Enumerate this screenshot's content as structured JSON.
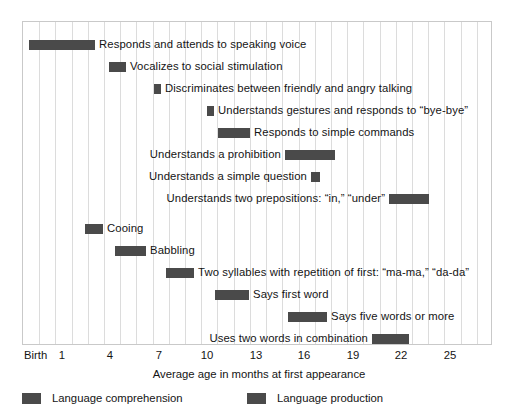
{
  "chart_data": {
    "type": "bar",
    "title": "",
    "subtitle": "",
    "xlabel": "Average age in months at first appearance",
    "ylabel": "",
    "xlim": [
      0,
      29
    ],
    "grid": true,
    "orientation": "horizontal",
    "legend_position": "bottom-left",
    "tick_labels": [
      "Birth",
      "1",
      "4",
      "7",
      "10",
      "13",
      "16",
      "19",
      "22",
      "25"
    ],
    "tick_values": [
      0,
      1,
      4,
      7,
      10,
      13,
      16,
      19,
      22,
      25
    ],
    "legend": [
      {
        "name": "Language comprehension",
        "color": "#4a4a4a"
      },
      {
        "name": "Language production",
        "color": "#4a4a4a"
      }
    ],
    "series": [
      {
        "name": "Language comprehension",
        "color": "#4a4a4a",
        "items": [
          {
            "label": "Responds and attends to speaking voice",
            "start": 0.3,
            "end": 4.5,
            "label_side": "right"
          },
          {
            "label": "Vocalizes to social stimulation",
            "start": 5.3,
            "end": 6.3,
            "label_side": "right"
          },
          {
            "label": "Discriminates between friendly and angry talking",
            "start": 8.5,
            "end": 8.9,
            "label_side": "right"
          },
          {
            "label": "Understands gestures and responds to “bye-bye”",
            "start": 11.8,
            "end": 12.2,
            "label_side": "right"
          },
          {
            "label": "Responds to simple commands",
            "start": 12.8,
            "end": 14.8,
            "label_side": "right"
          },
          {
            "label": "Understands a prohibition",
            "start": 17.0,
            "end": 20.1,
            "label_side": "left"
          },
          {
            "label": "Understands a simple question",
            "start": 18.5,
            "end": 19.0,
            "label_side": "left"
          },
          {
            "label": "Understands two prepositions: “in,” “under”",
            "start": 23.3,
            "end": 25.8,
            "label_side": "left"
          }
        ]
      },
      {
        "name": "Language production",
        "color": "#4a4a4a",
        "items": [
          {
            "label": "Cooing",
            "start": 3.8,
            "end": 4.9,
            "label_side": "right"
          },
          {
            "label": "Babbling",
            "start": 5.6,
            "end": 7.5,
            "label_side": "right"
          },
          {
            "label": "Two syllables with repetition of first: “ma-ma,” “da-da”",
            "start": 8.8,
            "end": 10.4,
            "label_side": "right"
          },
          {
            "label": "Says first word",
            "start": 11.9,
            "end": 14.0,
            "label_side": "right"
          },
          {
            "label": "Says five words or more",
            "start": 16.5,
            "end": 18.9,
            "label_side": "right"
          },
          {
            "label": "Uses two words in combination",
            "start": 21.7,
            "end": 24.0,
            "label_side": "left"
          },
          {
            "label": "Uses first pronoun, phrase, sentence",
            "start": 23.9,
            "end": 25.6,
            "label_side": "left"
          }
        ]
      }
    ],
    "rows": [
      {
        "label": "Responds and attends to speaking voice",
        "bar_left": 6,
        "bar_width": 66,
        "top": 12,
        "label_side": "right",
        "series": "Language comprehension"
      },
      {
        "label": "Vocalizes to social stimulation",
        "bar_left": 86,
        "bar_width": 17,
        "top": 34,
        "label_side": "right",
        "series": "Language comprehension"
      },
      {
        "label": "Discriminates between friendly and angry talking",
        "bar_left": 131,
        "bar_width": 7,
        "top": 56,
        "label_side": "right",
        "series": "Language comprehension"
      },
      {
        "label": "Understands gestures and responds to “bye-bye”",
        "bar_left": 184,
        "bar_width": 7,
        "top": 78,
        "label_side": "right",
        "series": "Language comprehension"
      },
      {
        "label": "Responds to simple commands",
        "bar_left": 195,
        "bar_width": 32,
        "top": 100,
        "label_side": "right",
        "series": "Language comprehension"
      },
      {
        "label": "Understands a prohibition",
        "bar_left": 262,
        "bar_width": 50,
        "top": 122,
        "label_side": "left",
        "series": "Language comprehension"
      },
      {
        "label": "Understands a simple question",
        "bar_left": 288,
        "bar_width": 9,
        "top": 144,
        "label_side": "left",
        "series": "Language comprehension"
      },
      {
        "label": "Understands two prepositions: “in,” “under”",
        "bar_left": 366,
        "bar_width": 40,
        "top": 166,
        "label_side": "left",
        "series": "Language comprehension"
      },
      {
        "label": "Cooing",
        "bar_left": 62,
        "bar_width": 18,
        "top": 196,
        "label_side": "right",
        "series": "Language production"
      },
      {
        "label": "Babbling",
        "bar_left": 92,
        "bar_width": 31,
        "top": 218,
        "label_side": "right",
        "series": "Language production"
      },
      {
        "label": "Two syllables with repetition of first: “ma-ma,” “da-da”",
        "bar_left": 143,
        "bar_width": 28,
        "top": 240,
        "label_side": "right",
        "series": "Language production"
      },
      {
        "label": "Says first word",
        "bar_left": 192,
        "bar_width": 34,
        "top": 262,
        "label_side": "right",
        "series": "Language production"
      },
      {
        "label": "Says five words or more",
        "bar_left": 265,
        "bar_width": 39,
        "top": 284,
        "label_side": "right",
        "series": "Language production"
      },
      {
        "label": "Uses two words in combination",
        "bar_left": 349,
        "bar_width": 37,
        "top": 306,
        "label_side": "left",
        "series": "Language production"
      },
      {
        "label": "Uses first pronoun, phrase, sentence",
        "bar_left": 385,
        "bar_width": 27,
        "top": 328,
        "label_side": "left",
        "series": "Language production"
      }
    ]
  },
  "axis": {
    "title": "Average age in months at first appearance",
    "ticks": [
      {
        "text": "Birth",
        "x": 24
      },
      {
        "text": "1",
        "x": 62
      },
      {
        "text": "4",
        "x": 110
      },
      {
        "text": "7",
        "x": 159
      },
      {
        "text": "10",
        "x": 207
      },
      {
        "text": "13",
        "x": 256
      },
      {
        "text": "16",
        "x": 304
      },
      {
        "text": "19",
        "x": 353
      },
      {
        "text": "22",
        "x": 401
      },
      {
        "text": "25",
        "x": 450
      }
    ]
  },
  "legend": {
    "comprehension_label": "Language comprehension",
    "production_label": "Language production",
    "swatch_color": "#4a4a4a"
  }
}
